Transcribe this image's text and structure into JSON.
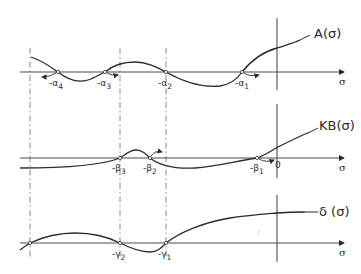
{
  "figure": {
    "panels": [
      {
        "id": "A",
        "function_label": "A(σ)",
        "axis_label": "σ",
        "roots": [
          "-α4",
          "-α3",
          "-α2",
          "-α1"
        ],
        "root_labels": [
          {
            "prefix": "-α",
            "sub": "4"
          },
          {
            "prefix": "-α",
            "sub": "3"
          },
          {
            "prefix": "-α",
            "sub": "2"
          },
          {
            "prefix": "-α",
            "sub": "1"
          }
        ]
      },
      {
        "id": "KB",
        "function_label": "KB(σ)",
        "axis_label": "σ",
        "origin_label": "0",
        "roots": [
          "-β3",
          "-β2",
          "-β1"
        ],
        "root_labels": [
          {
            "prefix": "-β",
            "sub": "3"
          },
          {
            "prefix": "-β",
            "sub": "2"
          },
          {
            "prefix": "-β",
            "sub": "1"
          }
        ]
      },
      {
        "id": "delta",
        "function_label": "δ (σ)",
        "axis_label": "σ",
        "roots": [
          "-γ2",
          "-γ1"
        ],
        "root_labels": [
          {
            "prefix": "-γ",
            "sub": "2"
          },
          {
            "prefix": "-γ",
            "sub": "1"
          }
        ]
      }
    ]
  }
}
